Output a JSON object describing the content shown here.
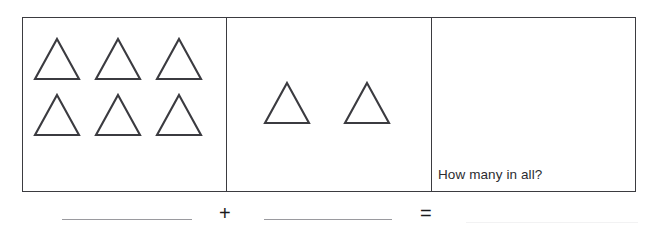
{
  "worksheet": {
    "question_text": "How many in all?",
    "panels": [
      {
        "name": "first-addend-panel",
        "shape": "triangle",
        "count": 6,
        "rows": [
          3,
          3
        ]
      },
      {
        "name": "second-addend-panel",
        "shape": "triangle",
        "count": 2,
        "rows": [
          2
        ]
      },
      {
        "name": "sum-panel",
        "shape": "triangle",
        "count": 0,
        "rows": []
      }
    ],
    "equation": {
      "plus_symbol": "+",
      "equals_symbol": "=",
      "first_blank_value": "",
      "second_blank_value": "",
      "answer_blank_value": ""
    },
    "colors": {
      "border": "#3b3b40",
      "shape_stroke": "#3b3b40",
      "shape_fill": "#ffffff",
      "text": "#2c2c30",
      "blank_line": "#9a9a9f",
      "background": "#ffffff"
    }
  }
}
